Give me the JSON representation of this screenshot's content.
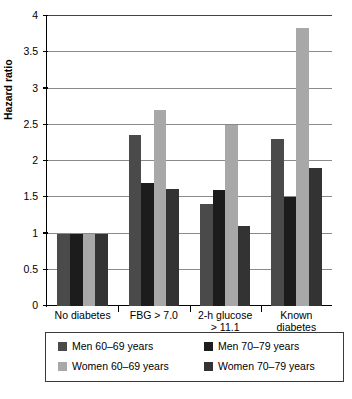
{
  "chart_data": {
    "type": "bar",
    "title": "",
    "xlabel": "",
    "ylabel": "Hazard ratio",
    "ylim": [
      0,
      4
    ],
    "ytick_labels": [
      "0",
      "0.5",
      "1",
      "1.5",
      "2",
      "2.5",
      "3",
      "3.5",
      "4"
    ],
    "ytick_values": [
      0,
      0.5,
      1,
      1.5,
      2,
      2.5,
      3,
      3.5,
      4
    ],
    "grid": true,
    "legend_position": "bottom",
    "categories": [
      "No diabetes",
      "FBG > 7.0",
      "2-h glucose > 11.1",
      "Known diabetes"
    ],
    "category_lines": [
      [
        "No diabetes"
      ],
      [
        "FBG > 7.0"
      ],
      [
        "2-h glucose",
        "> 11.1"
      ],
      [
        "Known",
        "diabetes"
      ]
    ],
    "series": [
      {
        "name": "Men 60–69 years",
        "color": "#4a4a4a",
        "values": [
          1.0,
          2.36,
          1.41,
          2.3
        ]
      },
      {
        "name": "Men 70–79 years",
        "color": "#1c1c1c",
        "values": [
          1.0,
          1.7,
          1.6,
          1.51
        ]
      },
      {
        "name": "Women 60–69 years",
        "color": "#a8a8a8",
        "values": [
          1.0,
          2.71,
          2.5,
          3.83
        ]
      },
      {
        "name": "Women 70–79 years",
        "color": "#333333",
        "values": [
          1.0,
          1.61,
          1.11,
          1.91
        ]
      }
    ]
  },
  "legend": {
    "items": [
      {
        "label": "Men 60–69 years",
        "color": "#4a4a4a"
      },
      {
        "label": "Men 70–79 years",
        "color": "#1c1c1c"
      },
      {
        "label": "Women 60–69 years",
        "color": "#a8a8a8"
      },
      {
        "label": "Women 70–79 years",
        "color": "#333333"
      }
    ]
  }
}
